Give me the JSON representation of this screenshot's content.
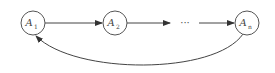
{
  "diagram": {
    "type": "cycle",
    "nodes": [
      {
        "id": "A1",
        "base": "A",
        "sub": "1",
        "x": 33,
        "y": 23
      },
      {
        "id": "A2",
        "base": "A",
        "sub": "2",
        "x": 115,
        "y": 23
      },
      {
        "id": "An",
        "base": "A",
        "sub": "n",
        "x": 247,
        "y": 23
      }
    ],
    "ellipsis": "···",
    "edges": [
      {
        "from": "A1",
        "to": "A2"
      },
      {
        "from": "A2",
        "to": "ellipsis"
      },
      {
        "from": "ellipsis",
        "to": "An"
      },
      {
        "from": "An",
        "to": "A1",
        "curved": true
      }
    ],
    "colors": {
      "stroke": "#444444",
      "background": "#ffffff"
    }
  }
}
